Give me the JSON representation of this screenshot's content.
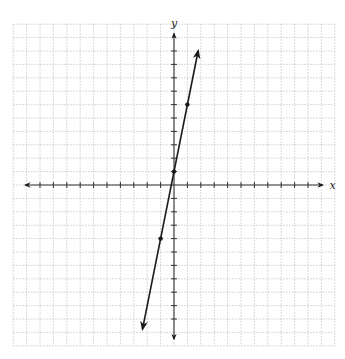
{
  "chart_data": {
    "type": "line",
    "title": "",
    "xlabel": "x",
    "ylabel": "y",
    "xlim": [
      -12,
      12
    ],
    "ylim": [
      -12,
      12
    ],
    "grid": true,
    "grid_style": "dotted",
    "axis_ticks": {
      "x": [
        -10,
        -9,
        -8,
        -7,
        -6,
        -5,
        -4,
        -3,
        -2,
        -1,
        1,
        2,
        3,
        4,
        5,
        6,
        7,
        8,
        9,
        10
      ],
      "y": [
        -10,
        -9,
        -8,
        -7,
        -6,
        -5,
        -4,
        -3,
        -2,
        -1,
        1,
        2,
        3,
        4,
        5,
        6,
        7,
        8,
        9,
        10
      ]
    },
    "tick_labels": false,
    "series": [
      {
        "name": "line",
        "equation": "y = 5x + 1",
        "slope": 5,
        "intercept": 1,
        "marked_points": [
          {
            "x": -1,
            "y": -4
          },
          {
            "x": 0,
            "y": 1
          },
          {
            "x": 1,
            "y": 6
          }
        ],
        "endpoints": [
          {
            "x": -2.35,
            "y": -10.75,
            "arrow": true
          },
          {
            "x": 1.8,
            "y": 10.0,
            "arrow": true
          }
        ]
      }
    ],
    "legend": null
  },
  "colors": {
    "grid": "#b8b8b8",
    "axis": "#333333",
    "line": "#1a1a1a"
  },
  "layout": {
    "origin_px": [
      174,
      185
    ],
    "unit_px": 13.4
  }
}
